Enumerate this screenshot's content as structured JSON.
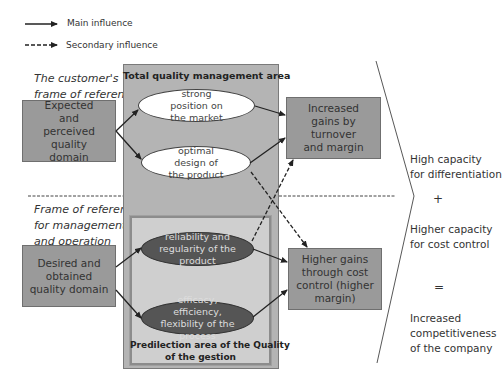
{
  "legend": {
    "main": "Main influence",
    "secondary": "Secondary influence"
  },
  "frames": {
    "customer": [
      "The customer's",
      "frame of reference"
    ],
    "management": [
      "Frame of reference",
      "for management",
      "and operation"
    ]
  },
  "left_boxes": {
    "expected": "Expected and perceived quality domain",
    "desired": "Desired and obtained quality domain"
  },
  "areas": {
    "tqm_title": "Total quality management area",
    "predilection_title_line1": "Predilection area of the Quality",
    "predilection_title_line2": "of the gestion"
  },
  "ellipses": {
    "strong_position": "strong position on the market",
    "optimal_design": "optimal design of the product",
    "reliability": "reliability and regularity of the product",
    "efficacy": "efficacy, efficiency, flexibility of the process"
  },
  "outcome_boxes": {
    "increased_gains": "Increased gains by turnover and margin",
    "higher_gains": "Higher gains through cost control (higher margin)"
  },
  "right": {
    "differentiation": [
      "High capacity",
      "for differentiation"
    ],
    "plus": "+",
    "cost_control": [
      "Higher capacity",
      "for cost control"
    ],
    "equals": "=",
    "competitiveness": [
      "Increased",
      "competitiveness",
      "of the company"
    ]
  },
  "colors": {
    "box_fill": "#9a9a9a",
    "area_fill": "#b4b4b4",
    "inner_area_fill": "#cfcfcf",
    "dark_ellipse": "#555555"
  }
}
